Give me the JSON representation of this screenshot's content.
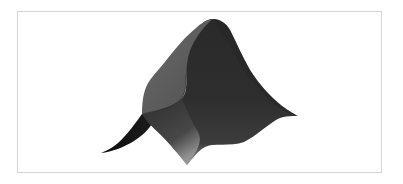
{
  "figure": {
    "kind": "3d-surface-render",
    "colors": {
      "background": "#ffffff",
      "frame_border": "#d4d4d4",
      "surface_dark": "#1e1e1e",
      "surface_mid": "#3a3a3a",
      "surface_light_face": "#5c5c5c",
      "blade_dark": "#111111",
      "bottom_fade": "#8a8a8a"
    }
  }
}
